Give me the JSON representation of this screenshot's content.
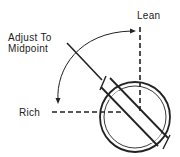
{
  "diagram": {
    "labels": {
      "lean": "Lean",
      "adjust_line1": "Adjust To",
      "adjust_line2": "Midpoint",
      "rich": "Rich"
    },
    "colors": {
      "line": "#222222",
      "background": "#ffffff"
    }
  }
}
